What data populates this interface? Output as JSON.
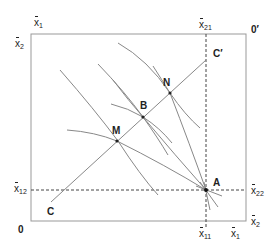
{
  "diagram": {
    "type": "edgeworth-box",
    "colors": {
      "line": "#888888",
      "box": "#999999",
      "text": "#222222",
      "dash": "#444444"
    },
    "corners": {
      "origin_bottom_left": "0",
      "origin_top_right": "0′"
    },
    "axis_labels": {
      "top_left_x": {
        "base": "x",
        "sub": "1"
      },
      "top_left_y": {
        "base": "x",
        "sub": "2"
      },
      "top_right_x": {
        "base": "x",
        "sub": "21"
      },
      "left_y": {
        "base": "x",
        "sub": "12"
      },
      "right_y": {
        "base": "x",
        "sub": "22"
      },
      "bottom_x": {
        "base": "x",
        "sub": "11"
      },
      "bottom_right_x": {
        "base": "x",
        "sub": "1"
      },
      "bottom_right_y": {
        "base": "x",
        "sub": "2"
      }
    },
    "points": {
      "A": "A",
      "B": "B",
      "M": "M",
      "N": "N",
      "C": "C",
      "C_prime": "C′"
    }
  }
}
